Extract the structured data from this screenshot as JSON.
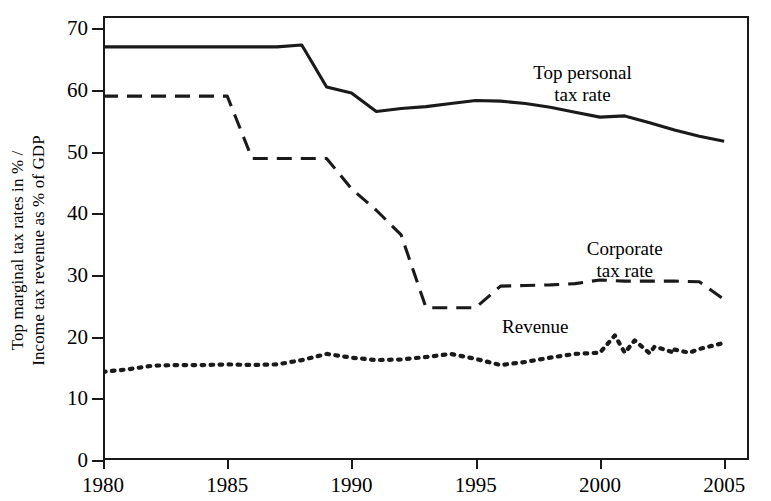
{
  "chart_data": {
    "type": "line",
    "title": "",
    "xlabel": "",
    "ylabel": "Top marginal tax rates in % /\nIncome tax revenue as % of GDP",
    "ylabel_line1": "Top marginal tax rates in % /",
    "ylabel_line2": "Income tax revenue as % of GDP",
    "xlim": [
      1980,
      2006
    ],
    "ylim": [
      0,
      72
    ],
    "yticks": [
      0,
      10,
      20,
      30,
      40,
      50,
      60,
      70
    ],
    "ytick_labels": [
      "0",
      "10",
      "20",
      "30",
      "40",
      "50",
      "60",
      "70"
    ],
    "xticks": [
      1980,
      1985,
      1990,
      1995,
      2000,
      2005
    ],
    "xtick_labels": [
      "1980",
      "1985",
      "1990",
      "1995",
      "2000",
      "2005"
    ],
    "grid": false,
    "legend_position": "inline-annotations",
    "x": [
      1980,
      1981,
      1982,
      1983,
      1984,
      1985,
      1986,
      1987,
      1988,
      1989,
      1990,
      1991,
      1992,
      1993,
      1994,
      1995,
      1996,
      1997,
      1998,
      1999,
      2000,
      2001,
      2002,
      2003,
      2004,
      2005
    ],
    "series": [
      {
        "name": "Top personal tax rate",
        "style": "solid",
        "color": "#1a1a1a",
        "label_x": 1999.3,
        "label_y": 64.5,
        "values": [
          67.0,
          67.0,
          67.0,
          67.0,
          67.0,
          67.0,
          67.0,
          67.0,
          67.3,
          60.5,
          59.5,
          56.5,
          57.0,
          57.3,
          57.8,
          58.3,
          58.2,
          57.8,
          57.2,
          56.4,
          55.6,
          55.8,
          54.7,
          53.5,
          52.5,
          51.7
        ]
      },
      {
        "name": "Corporate tax rate",
        "style": "dashed",
        "color": "#1a1a1a",
        "label_x": 2001.0,
        "label_y": 36.0,
        "values": [
          59.0,
          59.0,
          59.0,
          59.0,
          59.0,
          59.0,
          48.9,
          48.9,
          48.9,
          48.9,
          44.0,
          40.5,
          36.5,
          24.7,
          24.7,
          24.7,
          28.2,
          28.3,
          28.4,
          28.6,
          29.2,
          29.0,
          29.0,
          29.0,
          28.9,
          26.0
        ]
      },
      {
        "name": "Revenue",
        "style": "dotted",
        "color": "#1a1a1a",
        "label_x": 1997.4,
        "label_y": 23.3,
        "values": [
          14.3,
          14.7,
          15.3,
          15.4,
          15.4,
          15.5,
          15.4,
          15.5,
          16.2,
          17.2,
          16.6,
          16.2,
          16.3,
          16.7,
          17.2,
          16.4,
          15.4,
          15.9,
          16.6,
          17.2,
          17.4,
          17.4,
          17.3,
          17.4,
          18.0,
          19.0
        ]
      }
    ],
    "series_extra_points": {
      "Revenue": [
        {
          "x": 2000.6,
          "y": 20.2
        },
        {
          "x": 2001.4,
          "y": 19.4
        },
        {
          "x": 2002.2,
          "y": 18.4
        },
        {
          "x": 2003.0,
          "y": 17.9
        },
        {
          "x": 2003.6,
          "y": 17.4
        }
      ]
    },
    "annotations": [
      {
        "text": "Top personal\ntax rate",
        "line1": "Top personal",
        "line2": "tax rate"
      },
      {
        "text": "Corporate\ntax rate",
        "line1": "Corporate",
        "line2": "tax rate"
      },
      {
        "text": "Revenue",
        "line1": "Revenue",
        "line2": ""
      }
    ]
  },
  "axis": {
    "ytick_labels": [
      "70",
      "60",
      "50",
      "40",
      "30",
      "20",
      "10",
      "0"
    ],
    "xtick_labels": [
      "1980",
      "1985",
      "1990",
      "1995",
      "2000",
      "2005"
    ]
  },
  "annotations": {
    "personal_line1": "Top personal",
    "personal_line2": "tax rate",
    "corporate_line1": "Corporate",
    "corporate_line2": "tax rate",
    "revenue_line1": "Revenue"
  },
  "ylabel": {
    "line1": "Top marginal tax rates in % /",
    "line2": "Income tax revenue as % of GDP"
  }
}
